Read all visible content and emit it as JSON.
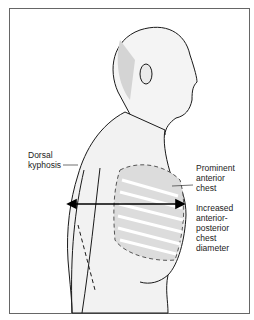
{
  "figure": {
    "labels": [
      {
        "id": "dorsal-kyphosis",
        "text": "Dorsal\nkyphosis"
      },
      {
        "id": "prominent-anterior-chest",
        "text": "Prominent\nanterior\nchest"
      },
      {
        "id": "increased-ap-diameter",
        "text": "Increased\nanterior-\nposterior\nchest\ndiameter"
      }
    ],
    "colors": {
      "border": "#555555",
      "line": "#1a1a1a",
      "shade": "#d8d8d8",
      "rib": "#c9c9c9"
    }
  }
}
